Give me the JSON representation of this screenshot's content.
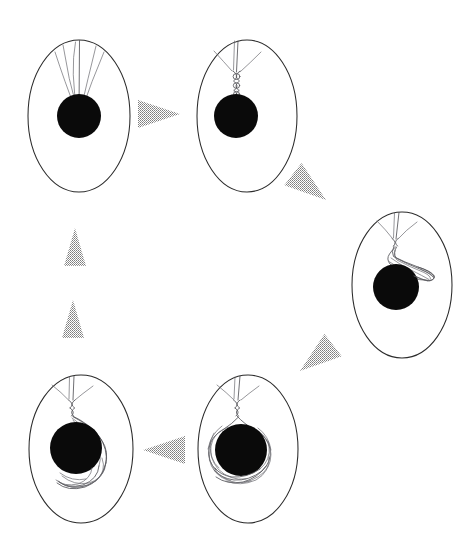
{
  "figure": {
    "background_color": "#ffffff",
    "width": 470,
    "height": 560,
    "stage_count": 5,
    "arrow_count": 6,
    "cycle_direction": "clockwise"
  },
  "palette": {
    "background": "#ffffff",
    "membrane_stroke": "#2b2b2b",
    "nucleus_fill": "#0a0a0a",
    "filament_stroke": "#55555a",
    "filament_thin_stroke": "#6a6a70",
    "arrow_fill": "#8c8c8c"
  },
  "stages": [
    {
      "id": "stage-1",
      "label": "Stage 1",
      "position": "top-left",
      "membrane": {
        "cx": 79,
        "cy": 116,
        "rx": 51,
        "ry": 76
      },
      "nucleus": {
        "cx": 79,
        "cy": 116,
        "r": 22
      },
      "filament_state": "straight-fan",
      "strand_count": 4,
      "description": "Straight filament strands fan from the upper membrane pole down to the nucleus"
    },
    {
      "id": "stage-2",
      "label": "Stage 2",
      "position": "top-right",
      "membrane": {
        "cx": 247,
        "cy": 116,
        "rx": 50,
        "ry": 76
      },
      "nucleus": {
        "cx": 236,
        "cy": 116,
        "r": 22
      },
      "filament_state": "braided-twist",
      "strand_count": 4,
      "description": "Strands converge and twist into a short braided segment above the nucleus"
    },
    {
      "id": "stage-3",
      "label": "Stage 3",
      "position": "right",
      "membrane": {
        "cx": 402,
        "cy": 285,
        "rx": 50,
        "ry": 73
      },
      "nucleus": {
        "cx": 396,
        "cy": 287,
        "r": 23
      },
      "filament_state": "single-lateral-loop",
      "strand_count": 4,
      "description": "A single elongated loop swings out laterally to the right over the nucleus"
    },
    {
      "id": "stage-4",
      "label": "Stage 4",
      "position": "bottom-middle",
      "membrane": {
        "cx": 248,
        "cy": 449,
        "rx": 50,
        "ry": 74
      },
      "nucleus": {
        "cx": 241,
        "cy": 450,
        "r": 26
      },
      "filament_state": "full-encircling-coils",
      "strand_count": 4,
      "description": "Filaments wrap fully around the nucleus in several overlapping coils"
    },
    {
      "id": "stage-5",
      "label": "Stage 5",
      "position": "bottom-left",
      "membrane": {
        "cx": 81,
        "cy": 449,
        "rx": 52,
        "ry": 74
      },
      "nucleus": {
        "cx": 76,
        "cy": 448,
        "r": 26
      },
      "filament_state": "relaxing-loops",
      "strand_count": 4,
      "description": "Coils relax into trailing loops hanging below and to the right of the nucleus"
    }
  ],
  "arrows": [
    {
      "id": "arrow-1-to-2",
      "from": "stage-1",
      "to": "stage-2",
      "direction": "right",
      "tip_x": 180,
      "tip_y": 114,
      "length": 42,
      "half_width": 14,
      "angle_deg": 0
    },
    {
      "id": "arrow-2-to-3",
      "from": "stage-2",
      "to": "stage-3",
      "direction": "down-right",
      "tip_x": 326,
      "tip_y": 200,
      "length": 42,
      "half_width": 14,
      "angle_deg": 38
    },
    {
      "id": "arrow-3-to-4",
      "from": "stage-3",
      "to": "stage-4",
      "direction": "down-left",
      "tip_x": 300,
      "tip_y": 371,
      "length": 42,
      "half_width": 14,
      "angle_deg": 142
    },
    {
      "id": "arrow-4-to-5",
      "from": "stage-4",
      "to": "stage-5",
      "direction": "left",
      "tip_x": 143,
      "tip_y": 450,
      "length": 42,
      "half_width": 14,
      "angle_deg": 180
    },
    {
      "id": "arrow-5-to-1-lower",
      "from": "stage-5",
      "to": "stage-1",
      "direction": "up",
      "tip_x": 73,
      "tip_y": 300,
      "length": 38,
      "half_width": 11,
      "angle_deg": 270
    },
    {
      "id": "arrow-5-to-1-upper",
      "from": "stage-5",
      "to": "stage-1",
      "direction": "up",
      "tip_x": 75,
      "tip_y": 228,
      "length": 38,
      "half_width": 11,
      "angle_deg": 270
    }
  ]
}
